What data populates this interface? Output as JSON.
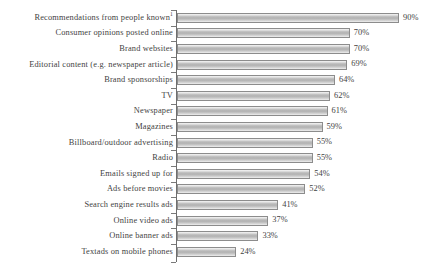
{
  "chart_data": {
    "type": "bar",
    "orientation": "horizontal",
    "title": "",
    "subtitle": "",
    "xlabel": "",
    "ylabel": "",
    "xlim": [
      0,
      100
    ],
    "grid": false,
    "legend": null,
    "value_suffix": "%",
    "footnote_marker": "1",
    "categories": [
      "Recommendations from people known",
      "Consumer opinions posted online",
      "Brand websites",
      "Editorial content (e.g. newspaper article)",
      "Brand sponsorships",
      "TV",
      "Newspaper",
      "Magazines",
      "Billboard/outdoor advertising",
      "Radio",
      "Emails signed up for",
      "Ads before movies",
      "Search engine results ads",
      "Online video ads",
      "Online banner ads",
      "Textads on mobile phones"
    ],
    "values": [
      90,
      70,
      70,
      69,
      64,
      62,
      61,
      59,
      55,
      55,
      54,
      52,
      41,
      37,
      33,
      24
    ],
    "data_labels": [
      "90%",
      "70%",
      "70%",
      "69%",
      "64%",
      "62%",
      "61%",
      "59%",
      "55%",
      "55%",
      "54%",
      "52%",
      "41%",
      "37%",
      "33%",
      "24%"
    ],
    "bars": [
      {
        "label": "Recommendations from people known",
        "superscript": "1",
        "value": 90,
        "display": "90%"
      },
      {
        "label": "Consumer opinions posted online",
        "superscript": "",
        "value": 70,
        "display": "70%"
      },
      {
        "label": "Brand websites",
        "superscript": "",
        "value": 70,
        "display": "70%"
      },
      {
        "label": "Editorial content (e.g. newspaper article)",
        "superscript": "",
        "value": 69,
        "display": "69%"
      },
      {
        "label": "Brand sponsorships",
        "superscript": "",
        "value": 64,
        "display": "64%"
      },
      {
        "label": "TV",
        "superscript": "",
        "value": 62,
        "display": "62%"
      },
      {
        "label": "Newspaper",
        "superscript": "",
        "value": 61,
        "display": "61%"
      },
      {
        "label": "Magazines",
        "superscript": "",
        "value": 59,
        "display": "59%"
      },
      {
        "label": "Billboard/outdoor advertising",
        "superscript": "",
        "value": 55,
        "display": "55%"
      },
      {
        "label": "Radio",
        "superscript": "",
        "value": 55,
        "display": "55%"
      },
      {
        "label": "Emails signed up for",
        "superscript": "",
        "value": 54,
        "display": "54%"
      },
      {
        "label": "Ads before movies",
        "superscript": "",
        "value": 52,
        "display": "52%"
      },
      {
        "label": "Search engine results ads",
        "superscript": "",
        "value": 41,
        "display": "41%"
      },
      {
        "label": "Online video ads",
        "superscript": "",
        "value": 37,
        "display": "37%"
      },
      {
        "label": "Online banner ads",
        "superscript": "",
        "value": 33,
        "display": "33%"
      },
      {
        "label": "Textads on mobile phones",
        "superscript": "",
        "value": 24,
        "display": "24%"
      }
    ],
    "colors": {
      "bar_fill_light": "#f4f4f4",
      "bar_fill_mid": "#b2b2b2",
      "bar_outline": "#8c8c8c",
      "axis": "#6e6e6e",
      "text": "#3f3f3f",
      "background": "#ffffff"
    },
    "scale": {
      "px_per_unit": 2.468,
      "axis_x_px": 176,
      "bar_start_x_px": 177
    }
  }
}
